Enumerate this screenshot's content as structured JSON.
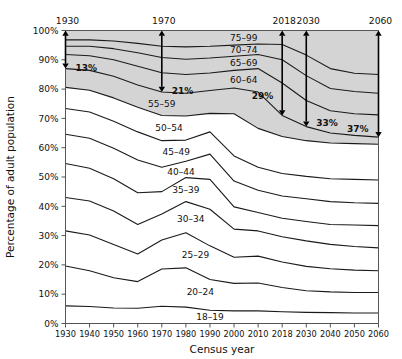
{
  "chart_data": {
    "type": "area",
    "title": "",
    "xlabel": "Census year",
    "ylabel": "Percentage of adult population",
    "ylim": [
      0,
      100
    ],
    "ytick_labels": [
      "0%",
      "10%",
      "20%",
      "30%",
      "40%",
      "50%",
      "60%",
      "70%",
      "80%",
      "90%",
      "100%"
    ],
    "ytick_values": [
      0,
      10,
      20,
      30,
      40,
      50,
      60,
      70,
      80,
      90,
      100
    ],
    "categories": [
      "1930",
      "1940",
      "1950",
      "1960",
      "1970",
      "1980",
      "1990",
      "2000",
      "2010",
      "2018",
      "2030",
      "2040",
      "2050",
      "2060"
    ],
    "grid": false,
    "legend": "inline band labels",
    "stacked": true,
    "shaded_region_note": "Age bands 60-64 and older are shaded gray",
    "series": [
      {
        "name": "18-19",
        "label": "18–19",
        "shaded": false,
        "cumulative": [
          6.0,
          5.8,
          5.3,
          5.2,
          5.9,
          5.6,
          4.5,
          4.3,
          4.3,
          4.0,
          3.8,
          3.7,
          3.6,
          3.6
        ]
      },
      {
        "name": "20-24",
        "label": "20–24",
        "shaded": false,
        "cumulative": [
          19.6,
          18.0,
          15.6,
          14.3,
          18.6,
          19.0,
          15.0,
          13.7,
          13.8,
          12.3,
          11.2,
          10.8,
          10.6,
          10.6
        ]
      },
      {
        "name": "25-29",
        "label": "25–29",
        "shaded": false,
        "cumulative": [
          31.6,
          30.2,
          27.0,
          23.7,
          28.5,
          31.0,
          26.5,
          22.6,
          23.0,
          21.0,
          19.5,
          18.7,
          18.2,
          18.0
        ]
      },
      {
        "name": "30-34",
        "label": "30–34",
        "shaded": false,
        "cumulative": [
          43.0,
          41.8,
          38.4,
          33.8,
          37.4,
          41.6,
          39.0,
          32.2,
          31.6,
          29.6,
          28.2,
          27.0,
          26.3,
          25.8
        ]
      },
      {
        "name": "35-39",
        "label": "35–39",
        "shaded": false,
        "cumulative": [
          54.6,
          53.0,
          49.4,
          44.6,
          45.0,
          49.8,
          49.2,
          39.8,
          37.9,
          35.9,
          34.8,
          33.8,
          33.6,
          33.4
        ]
      },
      {
        "name": "40-44",
        "label": "40–44",
        "shaded": false,
        "cumulative": [
          64.6,
          63.2,
          59.8,
          55.8,
          53.3,
          55.4,
          57.8,
          48.6,
          45.5,
          43.5,
          42.6,
          41.6,
          41.2,
          41.0
        ]
      },
      {
        "name": "45-49",
        "label": "45–49",
        "shaded": false,
        "cumulative": [
          73.4,
          72.2,
          69.0,
          65.4,
          62.4,
          62.6,
          65.4,
          57.2,
          53.3,
          51.2,
          50.2,
          49.4,
          49.2,
          49.0
        ]
      },
      {
        "name": "50-54",
        "label": "50–54",
        "shaded": false,
        "cumulative": [
          80.6,
          79.6,
          77.0,
          73.8,
          71.0,
          70.8,
          71.7,
          71.6,
          66.6,
          63.8,
          62.4,
          61.6,
          61.4,
          61.2
        ]
      },
      {
        "name": "55-59",
        "label": "55–59",
        "shaded": true,
        "cumulative": [
          87.0,
          86.4,
          84.4,
          81.4,
          79.0,
          78.6,
          79.5,
          80.4,
          79.0,
          71.0,
          67.2,
          65.0,
          64.2,
          63.6
        ]
      },
      {
        "name": "60-64",
        "label": "60–64",
        "shaded": true,
        "cumulative": [
          91.8,
          91.4,
          90.0,
          87.8,
          85.6,
          85.0,
          85.5,
          86.4,
          87.0,
          82.1,
          76.1,
          72.6,
          71.6,
          71.2
        ]
      },
      {
        "name": "65-69",
        "label": "65–69",
        "shaded": true,
        "cumulative": [
          94.6,
          94.6,
          93.8,
          92.4,
          90.8,
          90.2,
          90.6,
          91.2,
          91.8,
          90.0,
          84.6,
          80.2,
          79.2,
          78.6
        ]
      },
      {
        "name": "70-74",
        "label": "70–74",
        "shaded": true,
        "cumulative": [
          96.8,
          96.8,
          96.4,
          95.6,
          94.6,
          94.4,
          94.6,
          95.0,
          95.4,
          95.2,
          91.6,
          87.0,
          85.4,
          85.0
        ]
      },
      {
        "name": "75-99",
        "label": "75–99",
        "shaded": true,
        "cumulative": [
          100,
          100,
          100,
          100,
          100,
          100,
          100,
          100,
          100,
          100,
          100,
          100,
          100,
          100
        ]
      }
    ],
    "annotations": [
      {
        "year": "1930",
        "pct": "13%",
        "top": 100,
        "bottom": 87.0
      },
      {
        "year": "1970",
        "pct": "21%",
        "top": 100,
        "bottom": 79.0
      },
      {
        "year": "2018",
        "pct": "29%",
        "top": 100,
        "bottom": 71.0
      },
      {
        "year": "2030",
        "pct": "33%",
        "top": 100,
        "bottom": 67.2
      },
      {
        "year": "2060",
        "pct": "37%",
        "top": 100,
        "bottom": 63.6
      }
    ],
    "colors": {
      "shaded_fill": "#d4d4d4",
      "unshaded_fill": "#ffffff",
      "line": "#1a1a1a",
      "axis": "#555555",
      "text": "#111111"
    }
  }
}
